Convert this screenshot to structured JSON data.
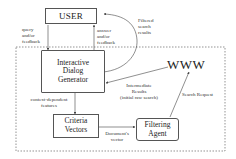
{
  "diagram": {
    "nodes": {
      "user": {
        "label": "USER"
      },
      "dialog": {
        "line1": "Interactive",
        "line2": "Dialog",
        "line3": "Generator"
      },
      "criteria": {
        "line1": "Criteria",
        "line2": "Vectors"
      },
      "filtering": {
        "line1": "Filtering",
        "line2": "Agent"
      },
      "www": {
        "label": "WWW"
      }
    },
    "edges": {
      "query": {
        "line1": "query",
        "line2": "and/or",
        "line3": "feedback"
      },
      "answer": {
        "line1": "answer",
        "line2": "and/or",
        "line3": "feedback"
      },
      "filtered": {
        "line1": "Filtered",
        "line2": "search",
        "line3": "results"
      },
      "context": {
        "line1": "context-dependent",
        "line2": "features"
      },
      "intermediate": {
        "line1": "Intermediate",
        "line2": "Results",
        "line3": "(initial raw search)"
      },
      "search_request": {
        "label": "Search Request"
      },
      "doc_vector": {
        "line1": "Document's",
        "line2": "vector"
      }
    }
  }
}
